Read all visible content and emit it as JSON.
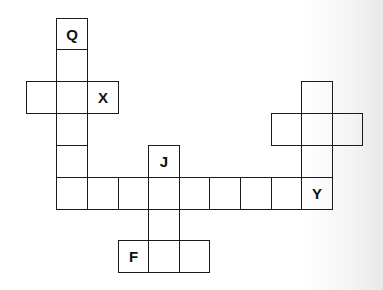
{
  "puzzle": {
    "col_edges": [
      26,
      56,
      87,
      118,
      148,
      179,
      209,
      240,
      271,
      301,
      332,
      362
    ],
    "row_edges": [
      18,
      49,
      81,
      113,
      145,
      177,
      209,
      240,
      272
    ],
    "cells": [
      {
        "col": 1,
        "row": 0,
        "label": "Q"
      },
      {
        "col": 1,
        "row": 1,
        "label": ""
      },
      {
        "col": 0,
        "row": 2,
        "label": ""
      },
      {
        "col": 1,
        "row": 2,
        "label": ""
      },
      {
        "col": 2,
        "row": 2,
        "label": "X"
      },
      {
        "col": 1,
        "row": 3,
        "label": ""
      },
      {
        "col": 1,
        "row": 4,
        "label": ""
      },
      {
        "col": 4,
        "row": 4,
        "label": "J"
      },
      {
        "col": 1,
        "row": 5,
        "label": ""
      },
      {
        "col": 2,
        "row": 5,
        "label": ""
      },
      {
        "col": 3,
        "row": 5,
        "label": ""
      },
      {
        "col": 4,
        "row": 5,
        "label": ""
      },
      {
        "col": 5,
        "row": 5,
        "label": ""
      },
      {
        "col": 6,
        "row": 5,
        "label": ""
      },
      {
        "col": 7,
        "row": 5,
        "label": ""
      },
      {
        "col": 8,
        "row": 5,
        "label": ""
      },
      {
        "col": 9,
        "row": 5,
        "label": "Y"
      },
      {
        "col": 4,
        "row": 6,
        "label": ""
      },
      {
        "col": 3,
        "row": 7,
        "label": "F"
      },
      {
        "col": 4,
        "row": 7,
        "label": ""
      },
      {
        "col": 5,
        "row": 7,
        "label": ""
      },
      {
        "col": 9,
        "row": 2,
        "label": ""
      },
      {
        "col": 8,
        "row": 3,
        "label": ""
      },
      {
        "col": 9,
        "row": 3,
        "label": ""
      },
      {
        "col": 10,
        "row": 3,
        "label": ""
      },
      {
        "col": 9,
        "row": 4,
        "label": ""
      }
    ]
  }
}
